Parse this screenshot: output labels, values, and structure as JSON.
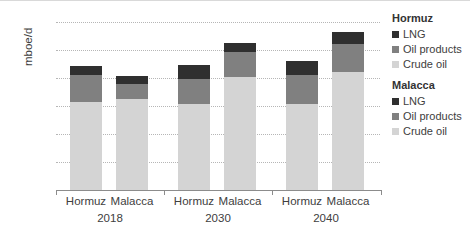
{
  "chart_data": {
    "type": "bar",
    "stacked": true,
    "title": "",
    "xlabel": "",
    "ylabel": "mboe/d",
    "ylim": [
      0,
      30
    ],
    "yticks": [
      5,
      10,
      15,
      20,
      25,
      30
    ],
    "grid": true,
    "legend_position": "right",
    "group_labels": [
      "2018",
      "2030",
      "2040"
    ],
    "categories": [
      "Hormuz 2018",
      "Malacca 2018",
      "Hormuz 2030",
      "Malacca 2030",
      "Hormuz 2040",
      "Malacca 2040"
    ],
    "series": [
      {
        "name": "Crude oil",
        "color": "#d4d4d4",
        "values": [
          15.7,
          16.3,
          15.3,
          20.1,
          15.4,
          21.0
        ]
      },
      {
        "name": "Oil products",
        "color": "#808080",
        "values": [
          4.9,
          2.6,
          4.5,
          4.6,
          5.2,
          5.1
        ]
      },
      {
        "name": "LNG",
        "color": "#2f2f2f",
        "values": [
          1.6,
          1.5,
          2.5,
          1.5,
          2.4,
          2.2
        ]
      }
    ],
    "totals": [
      22.2,
      20.4,
      22.3,
      26.2,
      23.0,
      28.3
    ]
  },
  "axis": {
    "y_label": "mboe/d",
    "y_ticks": [
      "30",
      "25",
      "20",
      "15",
      "10",
      "5"
    ],
    "x_categories": [
      "Hormuz",
      "Malacca",
      "Hormuz",
      "Malacca",
      "Hormuz",
      "Malacca"
    ],
    "x_groups": [
      "2018",
      "2030",
      "2040"
    ]
  },
  "legend": {
    "groups": [
      {
        "title": "Hormuz",
        "items": [
          {
            "label": "LNG",
            "color": "#2f2f2f"
          },
          {
            "label": "Oil products",
            "color": "#808080"
          },
          {
            "label": "Crude oil",
            "color": "#d4d4d4"
          }
        ]
      },
      {
        "title": "Malacca",
        "items": [
          {
            "label": "LNG",
            "color": "#2f2f2f"
          },
          {
            "label": "Oil products",
            "color": "#808080"
          },
          {
            "label": "Crude oil",
            "color": "#d4d4d4"
          }
        ]
      }
    ]
  }
}
